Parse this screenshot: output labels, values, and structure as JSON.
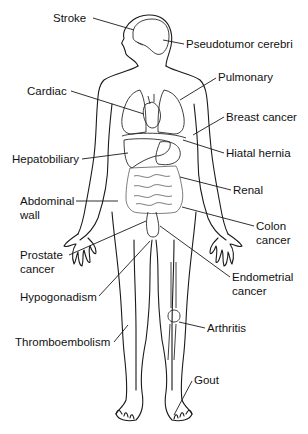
{
  "figure": {
    "background": "#ffffff",
    "line_color": "#1a1a1a"
  },
  "labels": [
    {
      "id": "stroke",
      "text": "Stroke",
      "x": 53,
      "y": 11
    },
    {
      "id": "pseudotumor",
      "text": "Pseudotumor cerebri",
      "x": 186,
      "y": 37
    },
    {
      "id": "pulmonary",
      "text": "Pulmonary",
      "x": 218,
      "y": 70
    },
    {
      "id": "cardiac",
      "text": "Cardiac",
      "x": 27,
      "y": 84
    },
    {
      "id": "breast-cancer",
      "text": "Breast cancer",
      "x": 226,
      "y": 110
    },
    {
      "id": "hiatal-hernia",
      "text": "Hiatal hernia",
      "x": 226,
      "y": 146
    },
    {
      "id": "hepatobiliary",
      "text": "Hepatobiliary",
      "x": 12,
      "y": 152
    },
    {
      "id": "renal",
      "text": "Renal",
      "x": 233,
      "y": 183
    },
    {
      "id": "abdominal-wall",
      "text": "Abdominal\nwall",
      "x": 20,
      "y": 194
    },
    {
      "id": "colon-cancer",
      "text": "Colon\ncancer",
      "x": 256,
      "y": 219
    },
    {
      "id": "prostate-cancer",
      "text": "Prostate\ncancer",
      "x": 20,
      "y": 248
    },
    {
      "id": "endometrial-cancer",
      "text": "Endometrial\ncancer",
      "x": 232,
      "y": 270
    },
    {
      "id": "hypogonadism",
      "text": "Hypogonadism",
      "x": 20,
      "y": 290
    },
    {
      "id": "arthritis",
      "text": "Arthritis",
      "x": 207,
      "y": 321
    },
    {
      "id": "thromboembolism",
      "text": "Thromboembolism",
      "x": 15,
      "y": 335
    },
    {
      "id": "gout",
      "text": "Gout",
      "x": 194,
      "y": 373
    }
  ],
  "leaders": [
    {
      "id": "stroke",
      "x1": 93,
      "y1": 18,
      "x2": 134,
      "y2": 30
    },
    {
      "id": "pseudotumor",
      "x1": 184,
      "y1": 44,
      "x2": 163,
      "y2": 40
    },
    {
      "id": "pulmonary",
      "x1": 216,
      "y1": 78,
      "x2": 180,
      "y2": 100
    },
    {
      "id": "cardiac",
      "x1": 71,
      "y1": 91,
      "x2": 144,
      "y2": 114
    },
    {
      "id": "breast-cancer",
      "x1": 224,
      "y1": 117,
      "x2": 193,
      "y2": 135
    },
    {
      "id": "hiatal-hernia",
      "x1": 224,
      "y1": 153,
      "x2": 183,
      "y2": 140
    },
    {
      "id": "hepatobiliary",
      "x1": 82,
      "y1": 159,
      "x2": 128,
      "y2": 153
    },
    {
      "id": "renal",
      "x1": 231,
      "y1": 190,
      "x2": 180,
      "y2": 177
    },
    {
      "id": "abdominal-wall",
      "x1": 76,
      "y1": 201,
      "x2": 118,
      "y2": 201
    },
    {
      "id": "colon-cancer",
      "x1": 254,
      "y1": 226,
      "x2": 182,
      "y2": 207
    },
    {
      "id": "prostate-cancer",
      "x1": 69,
      "y1": 255,
      "x2": 146,
      "y2": 221
    },
    {
      "id": "endometrial-cancer",
      "x1": 230,
      "y1": 277,
      "x2": 160,
      "y2": 226
    },
    {
      "id": "hypogonadism",
      "x1": 99,
      "y1": 296,
      "x2": 150,
      "y2": 241
    },
    {
      "id": "arthritis",
      "x1": 205,
      "y1": 328,
      "x2": 179,
      "y2": 322
    },
    {
      "id": "thromboembolism",
      "x1": 114,
      "y1": 342,
      "x2": 128,
      "y2": 325
    },
    {
      "id": "gout",
      "x1": 192,
      "y1": 381,
      "x2": 174,
      "y2": 415
    }
  ]
}
